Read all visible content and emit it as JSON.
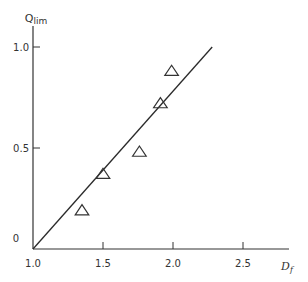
{
  "chart_data": {
    "type": "scatter",
    "title": "",
    "xlabel": "Df",
    "xlabel_main": "D",
    "xlabel_sub": "f",
    "ylabel": "Qlim",
    "ylabel_main": "Q",
    "ylabel_sub": "lim",
    "xlim": [
      1.0,
      2.8
    ],
    "ylim": [
      0,
      1.1
    ],
    "xticks": [
      1.0,
      1.5,
      2.0,
      2.5
    ],
    "xtick_labels": [
      "1.0",
      "1.5",
      "2.0",
      "2.5"
    ],
    "yticks": [
      0,
      0.5,
      1.0
    ],
    "ytick_labels": [
      "0",
      "0.5",
      "1.0"
    ],
    "grid": false,
    "legend": null,
    "series": [
      {
        "name": "data",
        "marker": "triangle-open",
        "points": [
          {
            "x": 1.35,
            "y": 0.19
          },
          {
            "x": 1.5,
            "y": 0.37
          },
          {
            "x": 1.76,
            "y": 0.48
          },
          {
            "x": 1.91,
            "y": 0.72
          },
          {
            "x": 1.99,
            "y": 0.88
          }
        ]
      },
      {
        "name": "fit-line",
        "type": "line",
        "points": [
          {
            "x": 1.0,
            "y": 0.0
          },
          {
            "x": 2.28,
            "y": 1.0
          }
        ]
      }
    ],
    "colors": {
      "axis": "#333333",
      "marker": "#333333",
      "line": "#2a2a2a"
    }
  }
}
